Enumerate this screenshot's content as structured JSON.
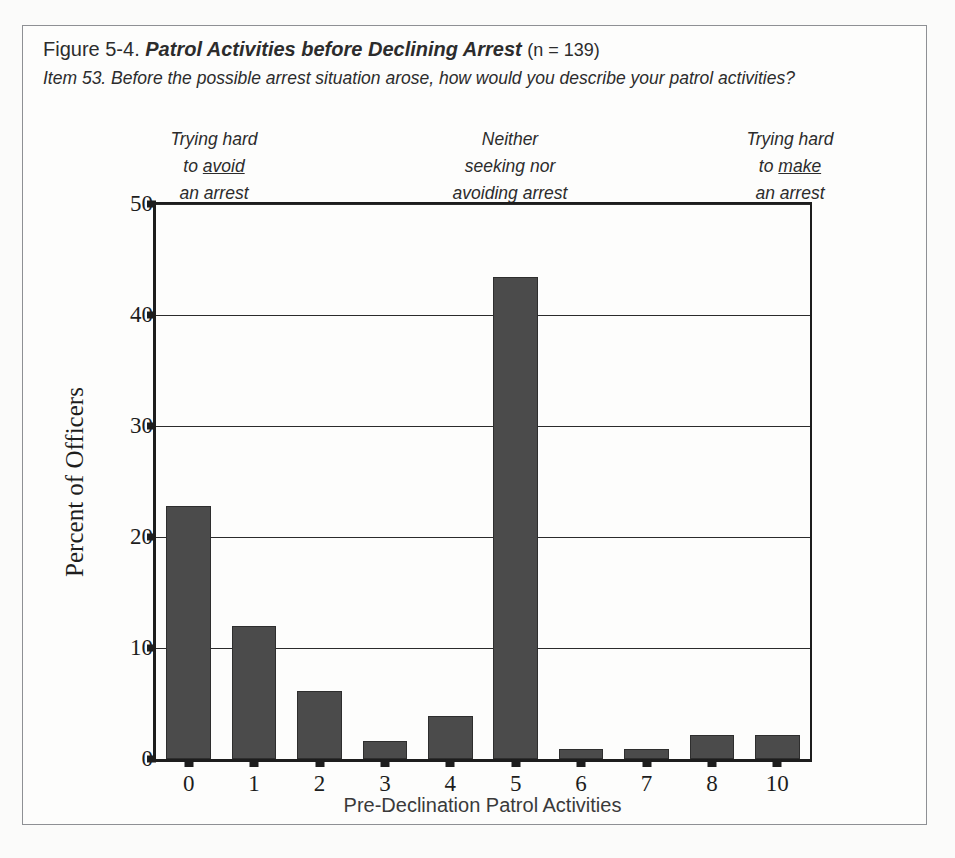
{
  "figure": {
    "number": "Figure 5-4.",
    "title": "Patrol Activities before Declining Arrest",
    "n_note": "(n = 139)",
    "item_question": "Item 53. Before the possible arrest situation arose, how would you describe your patrol activities?"
  },
  "anchors": {
    "left": {
      "line1": "Trying hard",
      "line2_pre": "to ",
      "line2_underline": "avoid",
      "line3": "an arrest"
    },
    "middle": {
      "line1": "Neither",
      "line2": "seeking nor",
      "line3": "avoiding arrest"
    },
    "right": {
      "line1": "Trying hard",
      "line2_pre": "to ",
      "line2_underline": "make",
      "line3": "an arrest"
    }
  },
  "colors": {
    "bar_fill": "#4b4b4b",
    "bar_edge": "#2e2e2e",
    "axis": "#1d1d1d",
    "frame": "#8e9094",
    "page_bg": "#fbfbfa"
  },
  "chart_data": {
    "type": "bar",
    "title": "Patrol Activities before Declining Arrest",
    "xlabel": "Pre-Declination Patrol Activities",
    "ylabel": "Percent of Officers",
    "categories": [
      "0",
      "1",
      "2",
      "3",
      "4",
      "5",
      "6",
      "7",
      "8",
      "10"
    ],
    "values": [
      22.8,
      12.0,
      6.1,
      1.6,
      3.9,
      43.4,
      0.9,
      0.9,
      2.2,
      2.2
    ],
    "ylim": [
      0,
      50
    ],
    "yticks": [
      0,
      10,
      20,
      30,
      40,
      50
    ],
    "grid": "horizontal",
    "legend": "none",
    "n": 139
  }
}
